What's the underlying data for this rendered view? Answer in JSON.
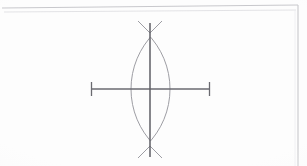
{
  "document": {
    "kind": "scanned-paper-sheet",
    "title": "Geometric compass construction",
    "background_color": "#fdfdfd",
    "canvas": {
      "width": 307,
      "height": 166
    }
  },
  "paper": {
    "edge_color": "#c8c8cc",
    "edge_color_soft": "#dcdce0",
    "top_edge": {
      "x1": 2,
      "y1": 8,
      "x2": 298,
      "y2": 5
    },
    "right_edge": {
      "x1": 298,
      "y1": 5,
      "x2": 298,
      "y2": 166
    },
    "inner_fold": {
      "x1": 4,
      "y1": 12,
      "x2": 296,
      "y2": 10
    }
  },
  "construction": {
    "name": "perpendicular-bisector-vesica-piscis",
    "ink_dark": "#5e5e64",
    "ink_light": "#9d9da3",
    "center": {
      "x": 150,
      "y": 89
    },
    "baseline": {
      "label": "horizontal-baseline-segment",
      "x1": 91,
      "x2": 210,
      "y": 89,
      "stroke_width": 1.5,
      "color": "#6a6a70"
    },
    "baseline_ticks": [
      {
        "label": "left-endpoint-tick",
        "x": 91,
        "y1": 82,
        "y2": 96
      },
      {
        "label": "right-endpoint-tick",
        "x": 210,
        "y1": 82,
        "y2": 96
      }
    ],
    "perpendicular": {
      "label": "vertical-perpendicular-bisector",
      "x": 150,
      "y1": 23,
      "y2": 157,
      "stroke_width": 1.5,
      "color": "#5e5e64"
    },
    "arcs": [
      {
        "label": "left-center-arc",
        "center_x": 91,
        "center_y": 89,
        "radius": 79,
        "color": "#9d9da3",
        "stroke_width": 1
      },
      {
        "label": "right-center-arc",
        "center_x": 210,
        "center_y": 89,
        "radius": 79,
        "color": "#9d9da3",
        "stroke_width": 1
      }
    ],
    "intersections": [
      {
        "label": "upper-arc-intersection",
        "x": 150,
        "y": 33
      },
      {
        "label": "lower-arc-intersection",
        "x": 150,
        "y": 146
      }
    ],
    "lens": {
      "label": "vesica-piscis-lens",
      "left_extreme_x": 128,
      "right_extreme_x": 171,
      "top_y": 33,
      "bottom_y": 146
    }
  }
}
